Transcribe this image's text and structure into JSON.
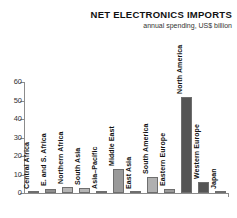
{
  "chart_data": {
    "type": "bar",
    "title": "NET ELECTRONICS IMPORTS",
    "subtitle": "annual spending, US$ billion",
    "xlabel": "",
    "ylabel": "",
    "ylim": [
      0,
      60
    ],
    "yticks": [
      0,
      10,
      20,
      30,
      40,
      50,
      60
    ],
    "grid": false,
    "legend": null,
    "categories": [
      "Central Africa",
      "E. and S. Africa",
      "Northern Africa",
      "South Asia",
      "Asia–Pacific",
      "Middle East",
      "East Asia",
      "South America",
      "Eastern Europe",
      "North America",
      "Western Europe",
      "Japan"
    ],
    "values": [
      0.7,
      2.3,
      3.2,
      2.6,
      0.2,
      13.2,
      0.2,
      8.6,
      2.4,
      52,
      5.8,
      0.1
    ],
    "bar_colors": [
      "#555555",
      "#8f8f8f",
      "#b5b5b5",
      "#b5b5b5",
      "#b5b5b5",
      "#9a9a9a",
      "#9a9a9a",
      "#b0b0b0",
      "#9a9a9a",
      "#555555",
      "#555555",
      "#b5b5b5"
    ]
  },
  "colors": {
    "axis": "#8c8c8c",
    "text": "#111111",
    "background": "#ffffff",
    "bar_dark": "#555555",
    "bar_light": "#b5b5b5"
  }
}
